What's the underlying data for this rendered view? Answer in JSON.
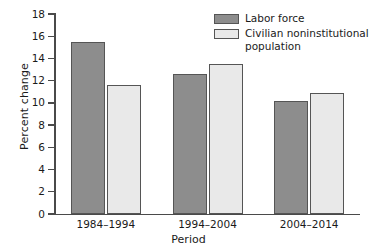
{
  "chart_data": {
    "type": "bar",
    "title": "",
    "xlabel": "Period",
    "ylabel": "Percent change",
    "categories": [
      "1984–1994",
      "1994–2004",
      "2004–2014"
    ],
    "series": [
      {
        "name": "Labor force",
        "values": [
          15.5,
          12.6,
          10.2
        ],
        "color": "#8d8d8d"
      },
      {
        "name": "Civilian noninstitutional population",
        "values": [
          11.6,
          13.5,
          10.9
        ],
        "color": "#e9e9e9"
      }
    ],
    "ylim": [
      0,
      18
    ],
    "ytick_step": 2,
    "yticks": [
      18,
      16,
      14,
      12,
      10,
      8,
      6,
      4,
      2,
      0
    ],
    "ytick_labels": [
      "18",
      "16",
      "14",
      "12",
      "10",
      "8",
      "6",
      "4",
      "2",
      "0"
    ],
    "grid": false,
    "legend_position": "top-right"
  },
  "legend": {
    "entries": [
      {
        "label": "Labor force"
      },
      {
        "label": "Civilian noninstitutional population"
      }
    ]
  },
  "axes": {
    "y_title": "Percent change",
    "x_title": "Period"
  },
  "title_remnant": ""
}
